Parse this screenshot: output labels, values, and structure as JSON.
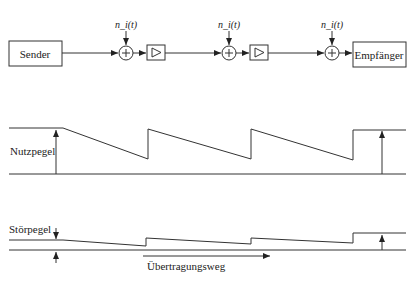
{
  "block_diagram": {
    "sender": "Sender",
    "receiver": "Empfänger",
    "noise_labels": [
      "n_i(t)",
      "n_i(t)",
      "n_i(t)"
    ]
  },
  "useful_level": {
    "label": "Nutzpegel"
  },
  "noise_level": {
    "label": "Störpegel"
  },
  "direction": {
    "label": "Übertragungsweg"
  }
}
